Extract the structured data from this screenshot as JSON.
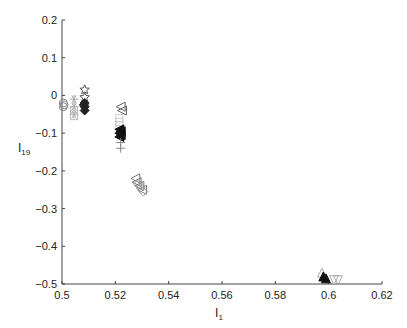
{
  "chart_data": {
    "type": "scatter",
    "title": "",
    "xlabel": "I",
    "xlabel_sub": "1",
    "ylabel": "I",
    "ylabel_sub": "19",
    "xlim": [
      0.5,
      0.62
    ],
    "ylim": [
      -0.5,
      0.2
    ],
    "grid": false,
    "legend": null,
    "x_ticks": [
      0.5,
      0.52,
      0.54,
      0.56,
      0.58,
      0.6,
      0.62
    ],
    "x_tick_labels": [
      "0.5",
      "0.52",
      "0.54",
      "0.56",
      "0.58",
      "0.6",
      "0.62"
    ],
    "y_ticks": [
      0.2,
      0.1,
      0,
      -0.1,
      -0.2,
      -0.3,
      -0.4,
      -0.5
    ],
    "y_tick_labels": [
      "0.2",
      "0.1",
      "0",
      "−0.1",
      "−0.2",
      "−0.3",
      "−0.4",
      "−0.5"
    ],
    "series": [
      {
        "name": "cluster-a",
        "marker": "circle",
        "color": "#888888",
        "points": [
          [
            0.5005,
            -0.02
          ],
          [
            0.5005,
            -0.03
          ],
          [
            0.5008,
            -0.025
          ]
        ]
      },
      {
        "name": "cluster-b",
        "marker": "asterisk",
        "color": "#aaaaaa",
        "points": [
          [
            0.5045,
            -0.01
          ],
          [
            0.5045,
            -0.03
          ],
          [
            0.5045,
            -0.05
          ]
        ]
      },
      {
        "name": "cluster-c",
        "marker": "square",
        "color": "#bbbbbb",
        "points": [
          [
            0.5045,
            -0.04
          ],
          [
            0.5045,
            -0.055
          ]
        ]
      },
      {
        "name": "cluster-d",
        "marker": "star",
        "color": "#555555",
        "points": [
          [
            0.5085,
            0.015
          ],
          [
            0.5085,
            -0.005
          ]
        ]
      },
      {
        "name": "cluster-e",
        "marker": "diamond-filled",
        "color": "#222222",
        "points": [
          [
            0.5085,
            -0.02
          ],
          [
            0.5085,
            -0.03
          ],
          [
            0.5085,
            -0.04
          ],
          [
            0.5082,
            -0.025
          ]
        ]
      },
      {
        "name": "cluster-f",
        "marker": "triangle-left",
        "color": "#666666",
        "points": [
          [
            0.522,
            -0.03
          ],
          [
            0.5225,
            -0.04
          ]
        ]
      },
      {
        "name": "cluster-g",
        "marker": "square",
        "color": "#cccccc",
        "points": [
          [
            0.5215,
            -0.06
          ],
          [
            0.5215,
            -0.07
          ],
          [
            0.5215,
            -0.08
          ]
        ]
      },
      {
        "name": "cluster-h",
        "marker": "triangle-left-filled",
        "color": "#111111",
        "points": [
          [
            0.5215,
            -0.09
          ],
          [
            0.5215,
            -0.1
          ],
          [
            0.5215,
            -0.11
          ],
          [
            0.522,
            -0.095
          ],
          [
            0.522,
            -0.105
          ]
        ]
      },
      {
        "name": "cluster-i",
        "marker": "plus",
        "color": "#888888",
        "points": [
          [
            0.522,
            -0.125
          ],
          [
            0.522,
            -0.14
          ]
        ]
      },
      {
        "name": "cluster-j",
        "marker": "triangle-left",
        "color": "#777777",
        "points": [
          [
            0.5275,
            -0.22
          ],
          [
            0.528,
            -0.23
          ],
          [
            0.529,
            -0.24
          ],
          [
            0.53,
            -0.25
          ]
        ]
      },
      {
        "name": "cluster-k",
        "marker": "diamond",
        "color": "#999999",
        "points": [
          [
            0.5285,
            -0.235
          ],
          [
            0.5295,
            -0.245
          ],
          [
            0.5305,
            -0.255
          ]
        ]
      },
      {
        "name": "cluster-l",
        "marker": "triangle-up",
        "color": "#aaaaaa",
        "points": [
          [
            0.5975,
            -0.47
          ]
        ]
      },
      {
        "name": "cluster-m",
        "marker": "triangle-up-filled",
        "color": "#111111",
        "points": [
          [
            0.598,
            -0.48
          ],
          [
            0.599,
            -0.485
          ]
        ]
      },
      {
        "name": "cluster-n",
        "marker": "triangle-down",
        "color": "#aaaaaa",
        "points": [
          [
            0.602,
            -0.49
          ],
          [
            0.6035,
            -0.49
          ]
        ]
      }
    ]
  }
}
